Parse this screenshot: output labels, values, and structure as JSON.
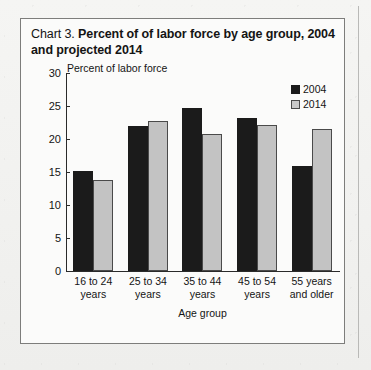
{
  "chart_data": {
    "type": "bar",
    "title": "Chart 3.  Percent of of labor force by age group, 2004 and projected 2014",
    "title_prefix": "Chart 3.",
    "title_main": "Percent of of labor force by age group, 2004 and projected 2014",
    "categories": [
      "16 to 24 years",
      "25 to 34 years",
      "35 to 44 years",
      "45 to 54 years",
      "55 years and older"
    ],
    "category_lines": [
      [
        "16 to 24",
        "years"
      ],
      [
        "25 to 34",
        "years"
      ],
      [
        "35 to 44",
        "years"
      ],
      [
        "45 to 54",
        "years"
      ],
      [
        "55 years",
        "and older"
      ]
    ],
    "series": [
      {
        "name": "2004",
        "color": "#1b1b1b",
        "values": [
          15.2,
          21.9,
          24.7,
          23.2,
          15.9
        ]
      },
      {
        "name": "2014",
        "color": "#c3c3c3",
        "values": [
          13.8,
          22.7,
          20.8,
          22.1,
          21.5
        ]
      }
    ],
    "xlabel": "Age group",
    "ylabel": "Percent of labor force",
    "ylim": [
      0,
      30
    ],
    "yticks": [
      0,
      5,
      10,
      15,
      20,
      25,
      30
    ],
    "ytick_labels": [
      "0",
      "5",
      "10",
      "15",
      "20",
      "25",
      "30"
    ],
    "grid": false,
    "legend_position": "top-right"
  }
}
